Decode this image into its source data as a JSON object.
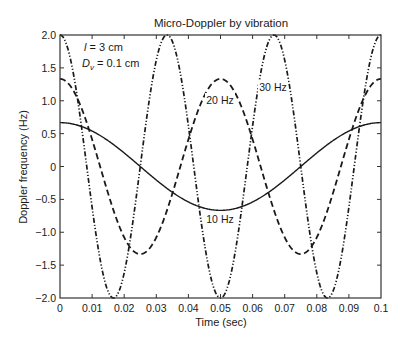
{
  "chart_data": {
    "type": "line",
    "title": "Micro-Doppler by vibration",
    "xlabel": "Time (sec)",
    "ylabel": "Doppler frequency (Hz)",
    "xlim": [
      0,
      0.1
    ],
    "ylim": [
      -2.0,
      2.0
    ],
    "grid": false,
    "x_ticks": [
      "0",
      "0.01",
      "0.02",
      "0.03",
      "0.04",
      "0.05",
      "0.06",
      "0.07",
      "0.08",
      "0.09",
      "0.1"
    ],
    "y_ticks": [
      "2.0",
      "1.5",
      "1.0",
      "0.5",
      "0",
      "−0.5",
      "−1.0",
      "−1.5",
      "−2.0"
    ],
    "annotation": {
      "line1_var": "l",
      "line1_rest": " = 3 cm",
      "line2_var": "D",
      "line2_sub": "v",
      "line2_rest": " = 0.1 cm"
    },
    "series": [
      {
        "name": "10 Hz",
        "label": "10 Hz",
        "style": "solid",
        "function": "0.667*cos(2*pi*10*t)",
        "amplitude": 0.667,
        "frequency": 10,
        "x": [
          0,
          0.01,
          0.02,
          0.025,
          0.03,
          0.04,
          0.05,
          0.06,
          0.07,
          0.075,
          0.08,
          0.09,
          0.1
        ],
        "values": [
          0.67,
          0.54,
          0.21,
          0.0,
          -0.21,
          -0.54,
          -0.67,
          -0.54,
          -0.21,
          0.0,
          0.21,
          0.54,
          0.67
        ]
      },
      {
        "name": "20 Hz",
        "label": "20 Hz",
        "style": "dashed",
        "function": "1.333*cos(2*pi*20*t)",
        "amplitude": 1.333,
        "frequency": 20,
        "x": [
          0,
          0.01,
          0.0125,
          0.02,
          0.025,
          0.03,
          0.0375,
          0.04,
          0.05,
          0.06,
          0.0625,
          0.07,
          0.075,
          0.08,
          0.0875,
          0.09,
          0.1
        ],
        "values": [
          1.33,
          0.41,
          0.0,
          -1.08,
          -1.33,
          -1.08,
          0.0,
          0.41,
          1.33,
          0.41,
          0.0,
          -1.08,
          -1.33,
          -1.08,
          0.0,
          0.41,
          1.33
        ]
      },
      {
        "name": "30 Hz",
        "label": "30 Hz",
        "style": "dash-dot-dot",
        "function": "2.0*cos(2*pi*30*t)",
        "amplitude": 2.0,
        "frequency": 30,
        "x": [
          0,
          0.0083,
          0.0167,
          0.025,
          0.0333,
          0.0417,
          0.05,
          0.0583,
          0.0667,
          0.075,
          0.0833,
          0.0917,
          0.1
        ],
        "values": [
          2.0,
          0.0,
          -2.0,
          0.0,
          2.0,
          0.0,
          -2.0,
          0.0,
          2.0,
          0.0,
          -2.0,
          0.0,
          2.0
        ]
      }
    ]
  }
}
